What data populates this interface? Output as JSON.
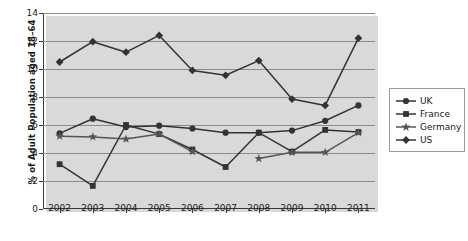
{
  "chart_data": {
    "type": "line",
    "title": "",
    "xlabel": "",
    "ylabel": "% of Adult Population aged 18–64",
    "x": [
      2002,
      2003,
      2004,
      2005,
      2006,
      2007,
      2008,
      2009,
      2010,
      2011
    ],
    "xticklabels": [
      "2002",
      "2003",
      "2004",
      "2005",
      "2006",
      "2007",
      "2008",
      "2009",
      "2010",
      "2011"
    ],
    "ylim": [
      0,
      14
    ],
    "yticks": [
      0,
      2,
      4,
      6,
      8,
      10,
      12,
      14
    ],
    "yticklabels": [
      "0",
      "2",
      "4",
      "6",
      "8",
      "10",
      "12",
      "14"
    ],
    "grid": "horizontal",
    "legend_position": "right",
    "series": [
      {
        "name": "UK",
        "marker": "circle",
        "color": "#333333",
        "values": [
          5.4,
          6.45,
          5.85,
          5.95,
          5.75,
          5.45,
          5.45,
          5.6,
          6.3,
          7.4
        ]
      },
      {
        "name": "France",
        "marker": "square",
        "color": "#333333",
        "values": [
          3.2,
          1.65,
          6.0,
          5.35,
          4.25,
          3.0,
          5.45,
          4.1,
          5.65,
          5.5
        ]
      },
      {
        "name": "Germany",
        "marker": "star",
        "color": "#555555",
        "values": [
          5.2,
          5.15,
          5.0,
          5.35,
          4.1,
          null,
          3.6,
          4.05,
          4.05,
          5.45
        ]
      },
      {
        "name": "US",
        "marker": "diamond",
        "color": "#333333",
        "values": [
          10.5,
          11.95,
          11.2,
          12.4,
          9.9,
          9.55,
          10.6,
          7.85,
          7.4,
          12.2
        ]
      }
    ]
  },
  "legend": {
    "items": [
      {
        "label": "UK",
        "marker": "circle"
      },
      {
        "label": "France",
        "marker": "square"
      },
      {
        "label": "Germany",
        "marker": "star"
      },
      {
        "label": "US",
        "marker": "diamond"
      }
    ]
  }
}
